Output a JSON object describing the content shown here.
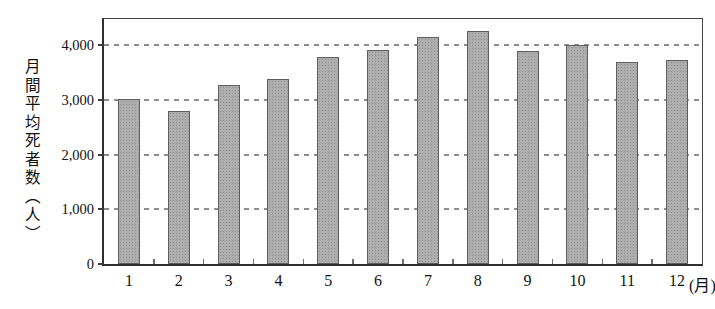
{
  "figure": {
    "background": "#ffffff"
  },
  "chart_data": {
    "type": "bar",
    "title": "",
    "ylabel": "月間平均死者数（人）",
    "xlabel": "",
    "x_unit_suffix": "(月)",
    "categories": [
      "1",
      "2",
      "3",
      "4",
      "5",
      "6",
      "7",
      "8",
      "9",
      "10",
      "11",
      "12"
    ],
    "values": [
      3020,
      2800,
      3270,
      3380,
      3780,
      3920,
      4150,
      4260,
      3890,
      4010,
      3690,
      3730
    ],
    "yticks": [
      0,
      1000,
      2000,
      3000,
      4000
    ],
    "ytick_labels": [
      "0",
      "1,000",
      "2,000",
      "3,000",
      "4,000"
    ],
    "ylim": [
      0,
      4480
    ],
    "grid": "horizontal-dashed",
    "legend": "none",
    "colors": {
      "bar_fill": "#aeaeae",
      "bar_dot_texture": "#8f8f8f",
      "bar_border": "#5e5e5e",
      "gridline": "#8e8e8e",
      "axis": "#2e2e2e",
      "text": "#111111"
    }
  }
}
